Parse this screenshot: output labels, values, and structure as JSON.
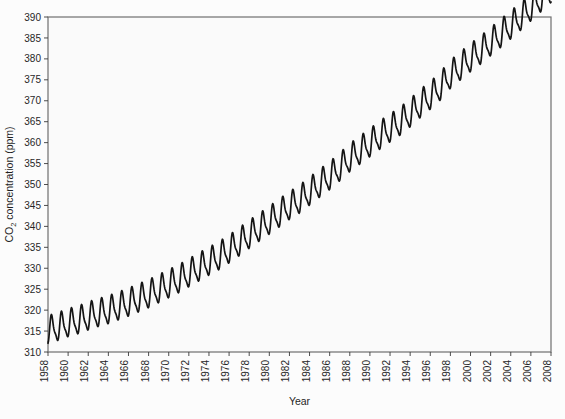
{
  "chart_data": {
    "type": "line",
    "title": "",
    "xlabel": "Year",
    "ylabel": "CO2 concentration (ppm)",
    "ylabel_parts": {
      "pre": "CO",
      "sub": "2",
      "post": " concentration (ppm)"
    },
    "xlim": [
      1958,
      2008
    ],
    "ylim": [
      310,
      390
    ],
    "grid": true,
    "legend": "none",
    "line_color": "#141414",
    "grid_color": "#d8d8d8",
    "background_color": "#fafafa",
    "yticks": [
      310,
      315,
      320,
      325,
      330,
      335,
      340,
      345,
      350,
      355,
      360,
      365,
      370,
      375,
      380,
      385,
      390
    ],
    "xticks": [
      1958,
      1960,
      1962,
      1964,
      1966,
      1968,
      1970,
      1972,
      1974,
      1976,
      1978,
      1980,
      1982,
      1984,
      1986,
      1988,
      1990,
      1992,
      1994,
      1996,
      1998,
      2000,
      2002,
      2004,
      2006,
      2008
    ],
    "seasonal_amplitude_ppm": 3.0,
    "series": [
      {
        "name": "CO2 concentration",
        "x": [
          1958.0,
          1958.5,
          1959.0,
          1959.5,
          1960.0,
          1960.5,
          1961.0,
          1961.5,
          1962.0,
          1962.5,
          1963.0,
          1963.5,
          1964.0,
          1964.5,
          1965.0,
          1965.5,
          1966.0,
          1966.5,
          1967.0,
          1967.5,
          1968.0,
          1968.5,
          1969.0,
          1969.5,
          1970.0,
          1970.5,
          1971.0,
          1971.5,
          1972.0,
          1972.5,
          1973.0,
          1973.5,
          1974.0,
          1974.5,
          1975.0,
          1975.5,
          1976.0,
          1976.5,
          1977.0,
          1977.5,
          1978.0,
          1978.5,
          1979.0,
          1979.5,
          1980.0,
          1980.5,
          1981.0,
          1981.5,
          1982.0,
          1982.5,
          1983.0,
          1983.5,
          1984.0,
          1984.5,
          1985.0,
          1985.5,
          1986.0,
          1986.5,
          1987.0,
          1987.5,
          1988.0,
          1988.5,
          1989.0,
          1989.5,
          1990.0,
          1990.5,
          1991.0,
          1991.5,
          1992.0,
          1992.5,
          1993.0,
          1993.5,
          1994.0,
          1994.5,
          1995.0,
          1995.5,
          1996.0,
          1996.5,
          1997.0,
          1997.5,
          1998.0,
          1998.5,
          1999.0,
          1999.5,
          2000.0,
          2000.5,
          2001.0,
          2001.5,
          2002.0,
          2002.5,
          2003.0,
          2003.5,
          2004.0,
          2004.5,
          2005.0,
          2005.5,
          2006.0,
          2006.5,
          2007.0,
          2007.5,
          2008.0
        ],
        "y_annual_trend": [
          315.0,
          315.4,
          315.8,
          316.2,
          316.7,
          317.0,
          317.4,
          317.8,
          318.3,
          318.7,
          319.1,
          319.4,
          319.8,
          320.2,
          320.7,
          321.1,
          321.6,
          322.1,
          322.6,
          323.1,
          323.6,
          324.2,
          324.8,
          325.4,
          326.0,
          326.6,
          327.2,
          327.9,
          328.6,
          329.3,
          330.0,
          330.7,
          331.4,
          332.0,
          332.7,
          333.5,
          334.3,
          335.1,
          336.0,
          336.9,
          337.8,
          338.6,
          339.5,
          340.3,
          341.2,
          342.0,
          342.9,
          343.8,
          344.7,
          345.4,
          346.2,
          347.1,
          348.1,
          349.0,
          350.0,
          350.9,
          351.8,
          352.8,
          353.9,
          355.0,
          356.1,
          357.0,
          357.9,
          358.8,
          359.7,
          360.6,
          361.5,
          362.4,
          363.2,
          364.0,
          364.8,
          365.8,
          366.8,
          367.9,
          369.0,
          370.0,
          371.0,
          372.0,
          373.2,
          374.6,
          376.0,
          377.0,
          378.0,
          379.0,
          380.0,
          380.9,
          381.8,
          382.8,
          383.8,
          384.8,
          385.8,
          386.8,
          387.8,
          388.8,
          389.9,
          391.0,
          392.1,
          393.2,
          394.3,
          395.4,
          396.5
        ]
      }
    ],
    "key_values": {
      "start_year": 1958,
      "start_ppm_approx": 315,
      "end_year": 2008,
      "end_ppm_approx": 385,
      "total_rise_ppm_approx": 70
    }
  },
  "plot_geometry": {
    "left": 48,
    "right": 551,
    "top": 17,
    "bottom": 352
  }
}
